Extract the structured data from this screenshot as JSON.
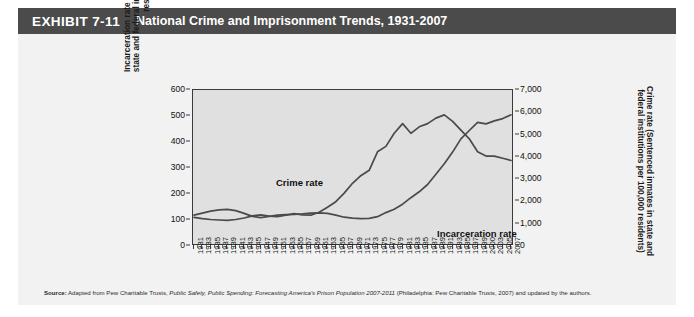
{
  "header": {
    "exhibit_label": "EXHIBIT 7-11",
    "title": "National Crime and Imprisonment Trends, 1931-2007",
    "bar_color": "#4b4b4b",
    "text_color": "#ffffff"
  },
  "source": {
    "prefix": "Source:",
    "text_1": " Adapted from Pew Charitable Trusts, ",
    "italic_1": "Public Safety, Public Spending: Forecasting America's Prison Population 2007-2011",
    "text_2": " (Philadelphia: Pew Charitable Trusts, 2007) and updated by the authors."
  },
  "chart_data": {
    "type": "line",
    "title": "National Crime and Imprisonment Trends, 1931-2007",
    "xlabel": "",
    "ylabel": "Incarceration rate (Sentenced inmates in state and federal institutions per 100,000 residents)",
    "ylabel_right": "Crime rate (Sentenced inmates in state and federal institutions per 100,000 residents)",
    "grid": false,
    "legend_position": "inline-annotations",
    "axis_left": {
      "label": "Incarceration rate (Sentenced inmates in state and federal institutions per 100,000 residents)",
      "ticks": [
        0,
        100,
        200,
        300,
        400,
        500,
        600
      ],
      "tick_labels": [
        "0",
        "100",
        "200",
        "300",
        "400",
        "500",
        "600"
      ],
      "ylim": [
        0,
        600
      ]
    },
    "axis_right": {
      "label": "Crime rate (Sentenced inmates in state and federal institutions per 100,000 residents)",
      "ticks": [
        0,
        1000,
        2000,
        3000,
        4000,
        5000,
        6000,
        7000
      ],
      "tick_labels": [
        "0",
        "1,000",
        "2,000",
        "3,000",
        "4,000",
        "5,000",
        "6,000",
        "7,000"
      ],
      "ylim": [
        0,
        7000
      ]
    },
    "x_tick_labels": [
      "1931",
      "1933",
      "1935",
      "1937",
      "1939",
      "1941",
      "1943",
      "1945",
      "1947",
      "1949",
      "1951",
      "1953",
      "1955",
      "1957",
      "1959",
      "1961",
      "1963",
      "1965",
      "1967",
      "1969",
      "1971",
      "1973",
      "1975",
      "1977",
      "1979",
      "1981",
      "1983",
      "1985",
      "1987",
      "1989",
      "1991",
      "1993",
      "1995",
      "1997",
      "1999",
      "2000",
      "2003",
      "2005",
      "2007"
    ],
    "x": [
      1931,
      1933,
      1935,
      1937,
      1939,
      1941,
      1943,
      1945,
      1947,
      1949,
      1951,
      1953,
      1955,
      1957,
      1959,
      1961,
      1963,
      1965,
      1967,
      1969,
      1971,
      1973,
      1975,
      1977,
      1979,
      1981,
      1983,
      1985,
      1987,
      1989,
      1991,
      1993,
      1995,
      1997,
      1999,
      2001,
      2003,
      2005,
      2007
    ],
    "series": [
      {
        "name": "Incarceration rate",
        "axis": "left",
        "color": "#4a4a4a",
        "values": [
          110,
          118,
          126,
          131,
          133,
          128,
          117,
          105,
          100,
          105,
          110,
          112,
          113,
          115,
          118,
          119,
          117,
          110,
          102,
          98,
          96,
          97,
          104,
          120,
          133,
          153,
          179,
          202,
          231,
          271,
          313,
          359,
          411,
          444,
          476,
          470,
          482,
          491,
          506
        ]
      },
      {
        "name": "Crime rate",
        "axis": "right",
        "color": "#4a4a4a",
        "values": [
          1180,
          1120,
          1080,
          1060,
          1040,
          1080,
          1150,
          1250,
          1300,
          1240,
          1210,
          1280,
          1350,
          1290,
          1280,
          1420,
          1650,
          1900,
          2300,
          2750,
          3100,
          3350,
          4200,
          4450,
          5050,
          5500,
          5050,
          5350,
          5500,
          5750,
          5900,
          5600,
          5200,
          4800,
          4200,
          4000,
          4000,
          3900,
          3800
        ]
      }
    ],
    "annotations": [
      {
        "text": "Crime rate",
        "x": 1962,
        "y_right": 3700
      },
      {
        "text": "Incarceration rate",
        "x": 1988,
        "y_left": 215
      }
    ]
  }
}
